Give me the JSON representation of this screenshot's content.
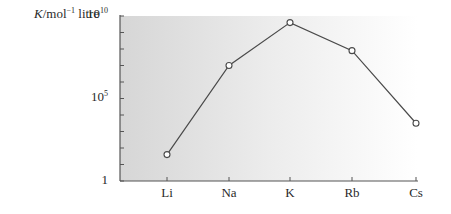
{
  "chart_data": {
    "type": "line",
    "title": "",
    "xlabel": "",
    "ylabel": "K/mol⁻¹ litre",
    "ylabel_parts": {
      "symbol": "K",
      "unit_base": "/mol",
      "unit_exp": "−1",
      "unit_tail": " litre"
    },
    "yscale": "log",
    "ylim": [
      1,
      10000000000
    ],
    "ytick_labels": [
      {
        "base": "10",
        "exp": "10",
        "log": 10
      },
      {
        "base": "10",
        "exp": "5",
        "log": 5
      },
      {
        "base": "1",
        "exp": "",
        "log": 0
      }
    ],
    "minor_ticks_per_decade": 1,
    "categories": [
      "Li",
      "Na",
      "K",
      "Rb",
      "Cs"
    ],
    "series": [
      {
        "name": "K",
        "log10_values": [
          1.6,
          7.0,
          9.6,
          7.9,
          3.5
        ],
        "values": [
          40,
          10000000,
          4000000000,
          80000000,
          3000
        ],
        "marker": "open-circle"
      }
    ],
    "grid": false,
    "legend": null
  },
  "style": {
    "plot_bg_left": "#d9d9d9",
    "plot_bg_right": "#ffffff",
    "line_color": "#4a4a4a",
    "axis_color": "#555555"
  }
}
